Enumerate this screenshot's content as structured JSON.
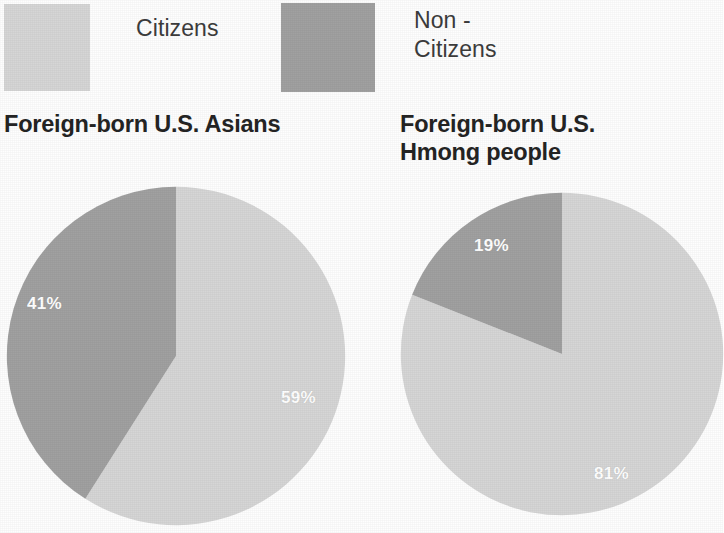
{
  "legend": {
    "items": [
      {
        "label": "Citizens",
        "color": "#d6d6d6",
        "swatch_name": "legend-swatch-citizens"
      },
      {
        "label": "Non -\nCitizens",
        "color": "#a1a1a1",
        "swatch_name": "legend-swatch-non-citizens"
      }
    ]
  },
  "charts": [
    {
      "title": "Foreign-born U.S. Asians",
      "labels": {
        "citizens": "59%",
        "non_citizens": "41%"
      }
    },
    {
      "title": "Foreign-born U.S.\nHmong people",
      "labels": {
        "citizens": "81%",
        "non_citizens": "19%"
      }
    }
  ],
  "chart_data": [
    {
      "type": "pie",
      "title": "Foreign-born U.S. Asians",
      "categories": [
        "Citizens",
        "Non - Citizens"
      ],
      "values": [
        59,
        41
      ],
      "data_labels": [
        "59%",
        "41%"
      ],
      "colors": [
        "#d6d6d6",
        "#a1a1a1"
      ],
      "units": "percent",
      "start_angle_deg": 0,
      "direction": "clockwise",
      "legend_position": "top",
      "grid": false
    },
    {
      "type": "pie",
      "title": "Foreign-born U.S. Hmong people",
      "categories": [
        "Citizens",
        "Non - Citizens"
      ],
      "values": [
        81,
        19
      ],
      "data_labels": [
        "81%",
        "19%"
      ],
      "colors": [
        "#d6d6d6",
        "#a1a1a1"
      ],
      "units": "percent",
      "start_angle_deg": 0,
      "direction": "clockwise",
      "legend_position": "top",
      "grid": false
    }
  ]
}
